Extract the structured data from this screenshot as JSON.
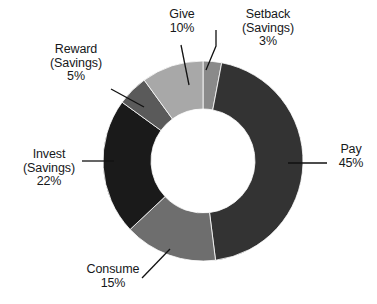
{
  "chart_data": {
    "type": "pie",
    "variant": "donut",
    "title": "",
    "subtitle": "",
    "xlabel": "",
    "ylabel": "",
    "legend_position": "none",
    "grid": false,
    "value_unit": "%",
    "total": 100,
    "categories": [
      "Setback (Savings)",
      "Pay",
      "Consume",
      "Invest (Savings)",
      "Reward (Savings)",
      "Give"
    ],
    "values": [
      3,
      45,
      15,
      22,
      5,
      10
    ],
    "colors": [
      "#8a8a8a",
      "#333333",
      "#6e6e6e",
      "#1a1a1a",
      "#5a5a5a",
      "#a8a8a8"
    ],
    "slices": [
      {
        "name": "setback-savings",
        "label_line1": "Setback",
        "label_line2": "(Savings)",
        "label_line3": "3%",
        "value": 3,
        "value_text": "3%",
        "color": "#8a8a8a"
      },
      {
        "name": "pay",
        "label_line1": "Pay",
        "label_line2": "45%",
        "label_line3": "",
        "value": 45,
        "value_text": "45%",
        "color": "#333333"
      },
      {
        "name": "consume",
        "label_line1": "Consume",
        "label_line2": "15%",
        "label_line3": "",
        "value": 15,
        "value_text": "15%",
        "color": "#6e6e6e"
      },
      {
        "name": "invest-savings",
        "label_line1": "Invest",
        "label_line2": "(Savings)",
        "label_line3": "22%",
        "value": 22,
        "value_text": "22%",
        "color": "#1a1a1a"
      },
      {
        "name": "reward-savings",
        "label_line1": "Reward",
        "label_line2": "(Savings)",
        "label_line3": "5%",
        "value": 5,
        "value_text": "5%",
        "color": "#5a5a5a"
      },
      {
        "name": "give",
        "label_line1": "Give",
        "label_line2": "10%",
        "label_line3": "",
        "value": 10,
        "value_text": "10%",
        "color": "#a8a8a8"
      }
    ]
  },
  "geometry": {
    "center_x": 203,
    "center_y": 161,
    "outer_radius": 100,
    "inner_radius": 52,
    "start_angle_deg": 0,
    "background": "#ffffff",
    "leader_color": "#111111"
  }
}
